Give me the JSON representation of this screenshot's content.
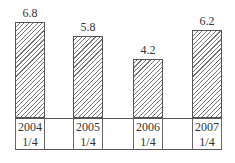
{
  "chart_data": {
    "type": "bar",
    "title": "",
    "xlabel": "",
    "ylabel": "",
    "categories": [
      "2004 1/4",
      "2005 1/4",
      "2006 1/4",
      "2007 1/4"
    ],
    "category_lines": [
      {
        "year": "2004",
        "quarter": "1/4"
      },
      {
        "year": "2005",
        "quarter": "1/4"
      },
      {
        "year": "2006",
        "quarter": "1/4"
      },
      {
        "year": "2007",
        "quarter": "1/4"
      }
    ],
    "values": [
      6.8,
      5.8,
      4.2,
      6.2
    ],
    "value_labels": [
      "6.8",
      "5.8",
      "4.2",
      "6.2"
    ],
    "ylim": [
      0,
      7.5
    ],
    "grid": false,
    "legend": null,
    "bar_fill": "diagonal-hatch",
    "colors": {
      "bar_border": "#555555",
      "hatch": "#777777",
      "text": "#333333"
    }
  }
}
